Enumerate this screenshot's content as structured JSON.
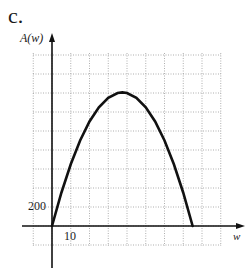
{
  "part_label": "c.",
  "chart_data": {
    "type": "line",
    "title": "",
    "xlabel": "w",
    "ylabel": "A(w)",
    "x_tick_labels": [
      {
        "value": 10,
        "label": "10"
      }
    ],
    "y_tick_labels": [
      {
        "value": 200,
        "label": "200"
      }
    ],
    "x_grid_step": 10,
    "y_grid_step": 200,
    "xlim": [
      -10,
      90
    ],
    "ylim": [
      -100,
      1800
    ],
    "grid": true,
    "grid_style": "dotted",
    "legend": null,
    "series": [
      {
        "name": "A(w)",
        "x": [
          0,
          5,
          10,
          15,
          20,
          25,
          30,
          35,
          37.5,
          40,
          45,
          50,
          55,
          60,
          65,
          70,
          75
        ],
        "y": [
          0,
          350,
          650,
          900,
          1100,
          1250,
          1350,
          1400,
          1406,
          1400,
          1350,
          1250,
          1100,
          900,
          650,
          350,
          0
        ]
      }
    ],
    "annotations": [
      "parabola opening downward with roots at w=0 and w≈75, maximum ≈1400 near w≈37.5"
    ]
  },
  "labels": {
    "y_axis": "A(w)",
    "x_axis": "w",
    "y_tick": "200",
    "x_tick": "10"
  }
}
